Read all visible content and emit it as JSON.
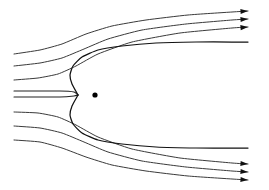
{
  "figure": {
    "title": "",
    "caption": "",
    "background_color": "#ffffff",
    "line_color": "#3a3a3a",
    "body_line_color": "#111111",
    "marker_color": "#000000",
    "width": 269,
    "height": 190
  },
  "chart_data": {
    "type": "line",
    "title": "",
    "subtitle": "",
    "xlabel": "",
    "ylabel": "",
    "xlim": [
      0,
      269
    ],
    "ylim": [
      0,
      190
    ],
    "grid": false,
    "legend": null,
    "annotations": [
      {
        "name": "source-point",
        "kind": "point-marker",
        "x": 95,
        "y": 95,
        "radius": 2.6,
        "label": ""
      },
      {
        "name": "stagnation-point",
        "kind": "implicit",
        "x": 78,
        "y": 95,
        "label": ""
      }
    ],
    "series": [
      {
        "name": "streamline-upper-1",
        "role": "free-streamline",
        "has_arrow": true,
        "stroke": "#3a3a3a",
        "width": 1.0,
        "points": [
          [
            14,
            54
          ],
          [
            40,
            50
          ],
          [
            62,
            44
          ],
          [
            86,
            34
          ],
          [
            112,
            26
          ],
          [
            146,
            20
          ],
          [
            188,
            15
          ],
          [
            232,
            12
          ],
          [
            248,
            11
          ]
        ]
      },
      {
        "name": "streamline-upper-2",
        "role": "free-streamline",
        "has_arrow": true,
        "stroke": "#3a3a3a",
        "width": 1.0,
        "points": [
          [
            14,
            66
          ],
          [
            40,
            63
          ],
          [
            62,
            58
          ],
          [
            84,
            49
          ],
          [
            108,
            39
          ],
          [
            142,
            30
          ],
          [
            186,
            24
          ],
          [
            232,
            20
          ],
          [
            248,
            19
          ]
        ]
      },
      {
        "name": "streamline-upper-3",
        "role": "free-streamline",
        "has_arrow": true,
        "stroke": "#3a3a3a",
        "width": 1.0,
        "points": [
          [
            14,
            80
          ],
          [
            38,
            78
          ],
          [
            58,
            74
          ],
          [
            76,
            66
          ],
          [
            98,
            54
          ],
          [
            132,
            42
          ],
          [
            180,
            33
          ],
          [
            232,
            28
          ],
          [
            248,
            27
          ]
        ]
      },
      {
        "name": "streamline-body-upper",
        "role": "dividing-streamline",
        "has_arrow": false,
        "stroke": "#111111",
        "width": 1.25,
        "points": [
          [
            78,
            95
          ],
          [
            72,
            84
          ],
          [
            70,
            75
          ],
          [
            73,
            66
          ],
          [
            82,
            57
          ],
          [
            98,
            50
          ],
          [
            122,
            46
          ],
          [
            156,
            43
          ],
          [
            196,
            42
          ],
          [
            232,
            42
          ],
          [
            248,
            42
          ]
        ]
      },
      {
        "name": "streamline-center-upper",
        "role": "axis-streamline",
        "has_arrow": false,
        "stroke": "#222222",
        "width": 1.1,
        "points": [
          [
            14,
            91
          ],
          [
            60,
            91
          ],
          [
            74,
            92
          ],
          [
            78,
            95
          ]
        ]
      },
      {
        "name": "streamline-center-lower",
        "role": "axis-streamline",
        "has_arrow": false,
        "stroke": "#222222",
        "width": 1.1,
        "points": [
          [
            14,
            97
          ],
          [
            60,
            97
          ],
          [
            74,
            96
          ],
          [
            78,
            95
          ]
        ]
      },
      {
        "name": "streamline-lower-3",
        "role": "free-streamline",
        "has_arrow": true,
        "stroke": "#3a3a3a",
        "width": 1.0,
        "points": [
          [
            14,
            112
          ],
          [
            38,
            113
          ],
          [
            58,
            117
          ],
          [
            76,
            125
          ],
          [
            98,
            137
          ],
          [
            132,
            149
          ],
          [
            180,
            158
          ],
          [
            232,
            163
          ],
          [
            248,
            164
          ]
        ]
      },
      {
        "name": "streamline-lower-2",
        "role": "free-streamline",
        "has_arrow": true,
        "stroke": "#3a3a3a",
        "width": 1.0,
        "points": [
          [
            14,
            126
          ],
          [
            40,
            128
          ],
          [
            62,
            133
          ],
          [
            84,
            142
          ],
          [
            108,
            152
          ],
          [
            142,
            161
          ],
          [
            186,
            167
          ],
          [
            232,
            171
          ],
          [
            248,
            172
          ]
        ]
      },
      {
        "name": "streamline-lower-1",
        "role": "free-streamline",
        "has_arrow": true,
        "stroke": "#3a3a3a",
        "width": 1.0,
        "points": [
          [
            14,
            140
          ],
          [
            40,
            142
          ],
          [
            62,
            148
          ],
          [
            86,
            157
          ],
          [
            112,
            165
          ],
          [
            146,
            171
          ],
          [
            188,
            176
          ],
          [
            232,
            179
          ],
          [
            248,
            180
          ]
        ]
      },
      {
        "name": "streamline-body-lower",
        "role": "dividing-streamline",
        "has_arrow": false,
        "stroke": "#111111",
        "width": 1.25,
        "points": [
          [
            78,
            95
          ],
          [
            72,
            106
          ],
          [
            70,
            115
          ],
          [
            73,
            124
          ],
          [
            82,
            133
          ],
          [
            98,
            140
          ],
          [
            122,
            144
          ],
          [
            156,
            147
          ],
          [
            196,
            148
          ],
          [
            232,
            148
          ],
          [
            248,
            148
          ]
        ]
      }
    ],
    "arrow_markers": [
      {
        "name": "arrow-upper-1",
        "x": 248,
        "y": 11,
        "angle": -4
      },
      {
        "name": "arrow-upper-2",
        "x": 248,
        "y": 19,
        "angle": -4
      },
      {
        "name": "arrow-upper-3",
        "x": 248,
        "y": 27,
        "angle": -5
      },
      {
        "name": "arrow-lower-3",
        "x": 248,
        "y": 164,
        "angle": 4
      },
      {
        "name": "arrow-lower-2",
        "x": 248,
        "y": 172,
        "angle": 4
      },
      {
        "name": "arrow-lower-1",
        "x": 248,
        "y": 180,
        "angle": 4
      }
    ]
  }
}
